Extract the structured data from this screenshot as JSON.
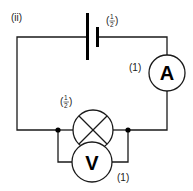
{
  "diagram": {
    "part_label": "(ii)",
    "battery": {
      "mark_label": "(1/2)",
      "mark_num": "1",
      "mark_den": "2"
    },
    "ammeter": {
      "symbol": "A",
      "mark_label": "(1)"
    },
    "lamp": {
      "mark_label": "(1/2)",
      "mark_num": "1",
      "mark_den": "2"
    },
    "voltmeter": {
      "symbol": "V",
      "mark_label": "(1)"
    },
    "colors": {
      "line": "#1a1a1a",
      "background": "#ffffff"
    }
  }
}
